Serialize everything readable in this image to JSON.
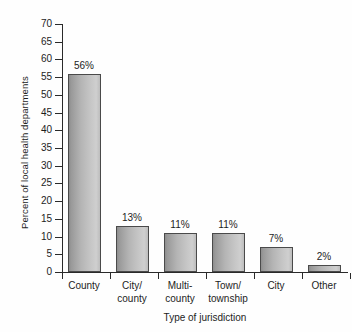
{
  "chart_data": {
    "type": "bar",
    "title": "",
    "xlabel": "Type of jurisdiction",
    "ylabel": "Percent of local health departments",
    "categories": [
      "County",
      "City/\ncounty",
      "Multi-\ncounty",
      "Town/\ntownship",
      "City",
      "Other"
    ],
    "values": [
      56,
      13,
      11,
      11,
      7,
      2
    ],
    "data_labels": [
      "56%",
      "13%",
      "11%",
      "11%",
      "7%",
      "2%"
    ],
    "ylim": [
      0,
      70
    ],
    "yticks": [
      0,
      5,
      10,
      15,
      20,
      25,
      30,
      35,
      40,
      45,
      50,
      55,
      60,
      65,
      70
    ],
    "ytick_labels": [
      "0",
      "5",
      "10",
      "15",
      "20",
      "25",
      "30",
      "35",
      "40",
      "45",
      "50",
      "55",
      "60",
      "65",
      "70"
    ],
    "grid": false,
    "legend": null,
    "bar_color": "#b4b4b4",
    "bar_edge_color": "#4a4a4a",
    "axis_color": "#2a2a2a",
    "background_color": "#ffffff"
  }
}
